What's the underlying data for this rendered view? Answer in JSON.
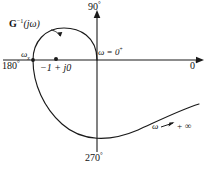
{
  "figure": {
    "name": "inverse-polar-plot"
  },
  "axes": {
    "top_label": "90",
    "top_degree": "°",
    "left_label": "180",
    "left_degree": "°",
    "right_label": "0",
    "right_degree": "°",
    "bottom_label": "270",
    "bottom_degree": "°"
  },
  "annotations": {
    "curve_label": {
      "base": "G",
      "exponent": "−1",
      "arg": "(jω)"
    },
    "omega_x": {
      "symbol": "ω",
      "subscript": "x"
    },
    "omega_zero": "ω = 0",
    "omega_zero_sup": "+",
    "omega_infinity": {
      "symbol": "ω",
      "arrow": "→",
      "value": "+ ∞"
    },
    "critical_point": "−1 + j0"
  },
  "chart_data": {
    "type": "line",
    "xlabel": "Real axis (0° – 180°)",
    "ylabel": "Imaginary axis (90° – 270°)",
    "grid": false,
    "legend": null,
    "axis_angles_deg": [
      0,
      90,
      180,
      270
    ],
    "marked_points": [
      {
        "label": "−1 + j0",
        "x": 56,
        "y": 59,
        "marker": "dot"
      },
      {
        "label": "ωₓ",
        "x": 33,
        "y": 60,
        "marker": "dot"
      },
      {
        "label": "ω = 0⁺",
        "x": 97,
        "y": 60,
        "marker": "curve-end"
      }
    ],
    "series": [
      {
        "name": "G⁻¹(jω)",
        "path": "M 97 60 C 97 36 79 28 64 28 C 45 28 33 42 33 60 C 33 84 44 108 62 124 C 82 142 110 142 138 130 C 160 120 180 110 199 104"
      }
    ]
  },
  "colors": {
    "stroke": "#1a1a1a",
    "background": "#ffffff",
    "text": "#111111"
  }
}
